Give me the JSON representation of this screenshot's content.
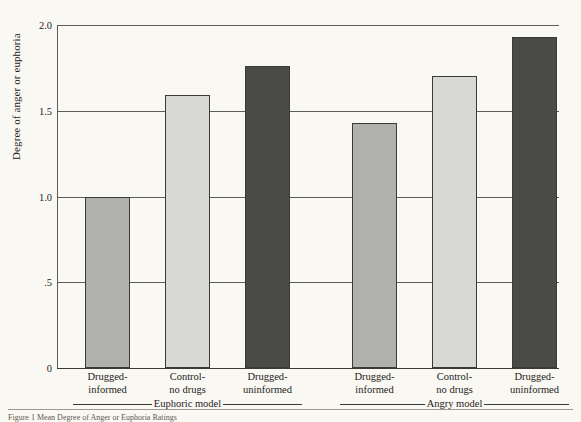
{
  "chart_data": {
    "type": "bar",
    "title": "",
    "xlabel": "",
    "ylabel": "Degree of anger or euphoria",
    "ylim": [
      0,
      2.0
    ],
    "yticks": [
      0,
      0.5,
      1.0,
      1.5,
      2.0
    ],
    "ytick_labels": [
      "0",
      ".5",
      "1.0",
      "1.5",
      "2.0"
    ],
    "grid": true,
    "legend": "none",
    "categories": [
      "Drugged-informed",
      "Control-no drugs",
      "Drugged-uninformed",
      "Drugged-informed",
      "Control-no drugs",
      "Drugged-uninformed"
    ],
    "values": [
      1.0,
      1.59,
      1.76,
      1.43,
      1.7,
      1.93
    ],
    "bar_colors": [
      "#b0b0ae",
      "#d8d8d4",
      "#4a4a48",
      "#b0b0ae",
      "#d8d8d4",
      "#4a4a48"
    ],
    "groups": [
      {
        "label": "Euphoric model",
        "bar_indices": [
          0,
          1,
          2
        ]
      },
      {
        "label": "Angry model",
        "bar_indices": [
          3,
          4,
          5
        ]
      }
    ]
  },
  "axis": {
    "y_title": "Degree of anger or euphoria",
    "ticks": [
      {
        "label": "2.0",
        "value": 2.0
      },
      {
        "label": "1.5",
        "value": 1.5
      },
      {
        "label": "1.0",
        "value": 1.0
      },
      {
        "label": ".5",
        "value": 0.5
      },
      {
        "label": "0",
        "value": 0
      }
    ]
  },
  "bars": [
    {
      "label_line1": "Drugged-",
      "label_line2": "informed",
      "value": 1.0,
      "color": "#b0b0ae"
    },
    {
      "label_line1": "Control-",
      "label_line2": "no drugs",
      "value": 1.59,
      "color": "#d8d8d4"
    },
    {
      "label_line1": "Drugged-",
      "label_line2": "uninformed",
      "value": 1.76,
      "color": "#4a4a48"
    },
    {
      "label_line1": "Drugged-",
      "label_line2": "informed",
      "value": 1.43,
      "color": "#b0b0ae"
    },
    {
      "label_line1": "Control-",
      "label_line2": "no drugs",
      "value": 1.7,
      "color": "#d8d8d4"
    },
    {
      "label_line1": "Drugged-",
      "label_line2": "uninformed",
      "value": 1.93,
      "color": "#4a4a48"
    }
  ],
  "groups": [
    {
      "label": "Euphoric model"
    },
    {
      "label": "Angry model"
    }
  ],
  "caption": {
    "text": "Figure 1   Mean Degree of Anger or Euphoria Ratings"
  },
  "colors": {
    "background": "#faf8f2",
    "axis": "#5d5d59",
    "bar_medium": "#b0b0ae",
    "bar_light": "#d8d8d4",
    "bar_dark": "#4a4a48",
    "text": "#1c1c1c"
  }
}
